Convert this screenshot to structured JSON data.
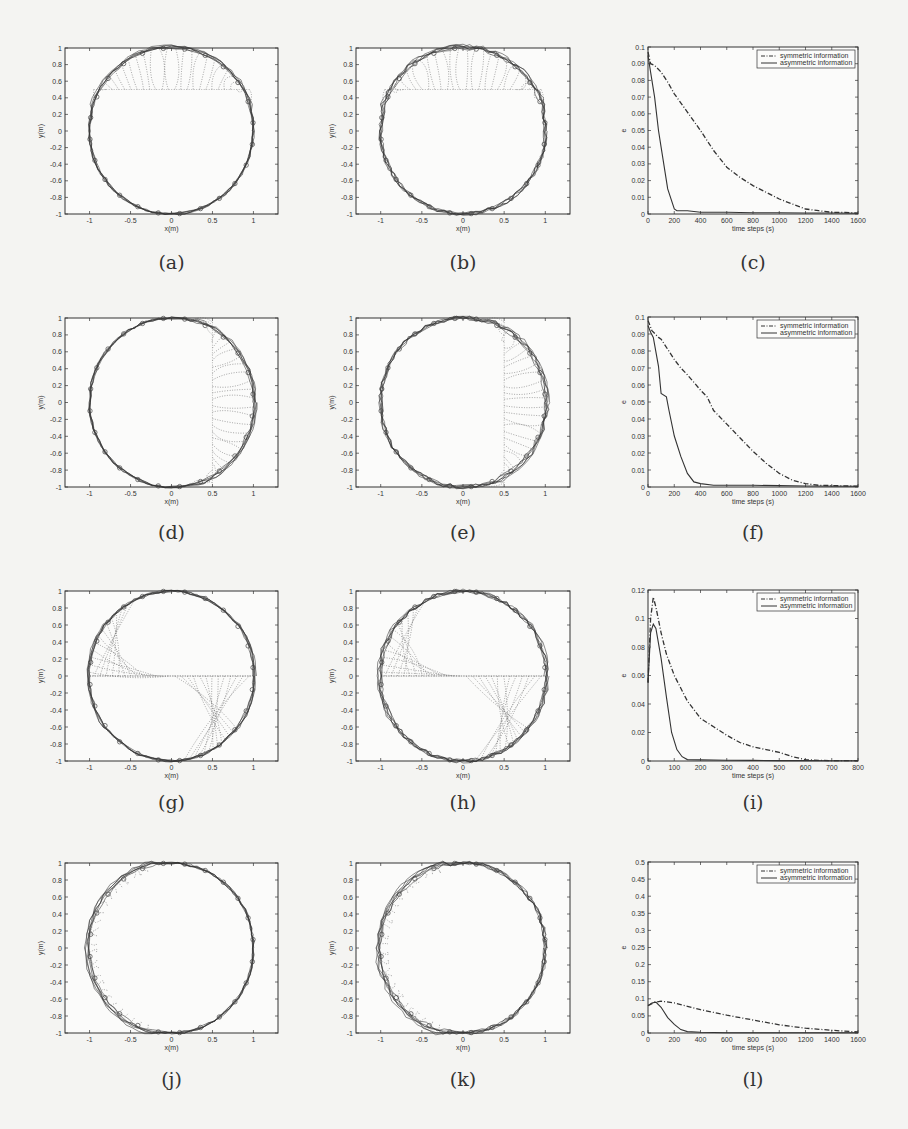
{
  "figure": {
    "panels": [
      {
        "id": "a",
        "label": "(a)",
        "kind": "trajectory",
        "start": "top-band",
        "box": [
          65,
          48,
          278,
          214
        ],
        "label_y": 263
      },
      {
        "id": "b",
        "label": "(b)",
        "kind": "trajectory",
        "start": "top-band",
        "box": [
          356,
          48,
          570,
          214
        ],
        "label_y": 263
      },
      {
        "id": "c",
        "label": "(c)",
        "kind": "error",
        "box": [
          648,
          47,
          858,
          214
        ],
        "label_y": 263
      },
      {
        "id": "d",
        "label": "(d)",
        "kind": "trajectory",
        "start": "right-band",
        "box": [
          65,
          318,
          278,
          487
        ],
        "label_y": 533
      },
      {
        "id": "e",
        "label": "(e)",
        "kind": "trajectory",
        "start": "right-band",
        "box": [
          356,
          318,
          570,
          487
        ],
        "label_y": 533
      },
      {
        "id": "f",
        "label": "(f)",
        "kind": "error",
        "box": [
          648,
          317,
          858,
          487
        ],
        "label_y": 533
      },
      {
        "id": "g",
        "label": "(g)",
        "kind": "trajectory",
        "start": "center-line",
        "box": [
          65,
          591,
          278,
          761
        ],
        "label_y": 803
      },
      {
        "id": "h",
        "label": "(h)",
        "kind": "trajectory",
        "start": "center-line",
        "box": [
          356,
          591,
          570,
          761
        ],
        "label_y": 803
      },
      {
        "id": "i",
        "label": "(i)",
        "kind": "error",
        "box": [
          648,
          590,
          858,
          761
        ],
        "label_y": 803
      },
      {
        "id": "j",
        "label": "(j)",
        "kind": "trajectory",
        "start": "left-arc",
        "box": [
          65,
          863,
          278,
          1033
        ],
        "label_y": 1080
      },
      {
        "id": "k",
        "label": "(k)",
        "kind": "trajectory",
        "start": "left-arc",
        "box": [
          356,
          863,
          570,
          1033
        ],
        "label_y": 1080
      },
      {
        "id": "l",
        "label": "(l)",
        "kind": "error",
        "box": [
          648,
          862,
          858,
          1033
        ],
        "label_y": 1080
      }
    ]
  },
  "chart_data": [
    {
      "panel": "a",
      "type": "line",
      "title": "",
      "xlabel": "x(m)",
      "ylabel": "y(m)",
      "xlim": [
        -1.3,
        1.3
      ],
      "ylim": [
        -1,
        1
      ],
      "xticks": [
        -1,
        -0.5,
        0,
        0.5,
        1
      ],
      "yticks": [
        -1,
        -0.8,
        -0.6,
        -0.4,
        -0.2,
        0,
        0.2,
        0.4,
        0.6,
        0.8,
        1
      ],
      "grid": false,
      "description": "Agents start on horizontal line y=0.5 and converge onto unit circle"
    },
    {
      "panel": "b",
      "type": "line",
      "title": "",
      "xlabel": "x(m)",
      "ylabel": "y(m)",
      "xlim": [
        -1.3,
        1.3
      ],
      "ylim": [
        -1,
        1
      ],
      "xticks": [
        -1,
        -0.5,
        0,
        0.5,
        1
      ],
      "yticks": [
        -1,
        -0.8,
        -0.6,
        -0.4,
        -0.2,
        0,
        0.2,
        0.4,
        0.6,
        0.8,
        1
      ],
      "grid": false,
      "description": "Agents start on horizontal line y=0.5 and converge onto unit circle"
    },
    {
      "panel": "c",
      "type": "line",
      "title": "",
      "xlabel": "time steps (s)",
      "ylabel": "e",
      "xlim": [
        0,
        1600
      ],
      "ylim": [
        0,
        0.1
      ],
      "xticks": [
        0,
        200,
        400,
        600,
        800,
        1000,
        1200,
        1400,
        1600
      ],
      "yticks": [
        0,
        0.01,
        0.02,
        0.03,
        0.04,
        0.05,
        0.06,
        0.07,
        0.08,
        0.09,
        0.1
      ],
      "legend": [
        "symmetric information",
        "asymmetric information"
      ],
      "legend_position": "upper right",
      "series": [
        {
          "name": "symmetric information",
          "style": "dashdot",
          "x": [
            0,
            20,
            50,
            100,
            150,
            200,
            300,
            400,
            500,
            600,
            700,
            800,
            900,
            1000,
            1100,
            1200,
            1300,
            1400,
            1500,
            1600
          ],
          "values": [
            0.097,
            0.09,
            0.089,
            0.085,
            0.079,
            0.072,
            0.061,
            0.05,
            0.038,
            0.028,
            0.022,
            0.017,
            0.013,
            0.009,
            0.006,
            0.003,
            0.002,
            0.001,
            0.001,
            0.0005
          ]
        },
        {
          "name": "asymmetric information",
          "style": "solid",
          "x": [
            0,
            20,
            50,
            80,
            100,
            150,
            200,
            220,
            300,
            400,
            600,
            800,
            1000,
            1200,
            1400,
            1600
          ],
          "values": [
            0.095,
            0.085,
            0.07,
            0.05,
            0.04,
            0.015,
            0.003,
            0.002,
            0.002,
            0.001,
            0.001,
            0.0008,
            0.0008,
            0.0006,
            0.0006,
            0.0005
          ]
        }
      ]
    },
    {
      "panel": "d",
      "type": "line",
      "title": "",
      "xlabel": "x(m)",
      "ylabel": "y(m)",
      "xlim": [
        -1.3,
        1.3
      ],
      "ylim": [
        -1,
        1
      ],
      "xticks": [
        -1,
        -0.5,
        0,
        0.5,
        1
      ],
      "yticks": [
        -1,
        -0.8,
        -0.6,
        -0.4,
        -0.2,
        0,
        0.2,
        0.4,
        0.6,
        0.8,
        1
      ],
      "grid": false,
      "description": "Agents start on vertical line x=0.5 and converge onto unit circle"
    },
    {
      "panel": "e",
      "type": "line",
      "title": "",
      "xlabel": "x(m)",
      "ylabel": "y(m)",
      "xlim": [
        -1.3,
        1.3
      ],
      "ylim": [
        -1,
        1
      ],
      "xticks": [
        -1,
        -0.5,
        0,
        0.5,
        1
      ],
      "yticks": [
        -1,
        -0.8,
        -0.6,
        -0.4,
        -0.2,
        0,
        0.2,
        0.4,
        0.6,
        0.8,
        1
      ],
      "grid": false,
      "description": "Agents start on vertical line x=0.5 and converge onto unit circle"
    },
    {
      "panel": "f",
      "type": "line",
      "title": "",
      "xlabel": "time steps (s)",
      "ylabel": "e",
      "xlim": [
        0,
        1600
      ],
      "ylim": [
        0,
        0.1
      ],
      "xticks": [
        0,
        200,
        400,
        600,
        800,
        1000,
        1200,
        1400,
        1600
      ],
      "yticks": [
        0,
        0.01,
        0.02,
        0.03,
        0.04,
        0.05,
        0.06,
        0.07,
        0.08,
        0.09,
        0.1
      ],
      "legend": [
        "symmetric information",
        "asymmetric information"
      ],
      "legend_position": "upper right",
      "series": [
        {
          "name": "symmetric information",
          "style": "dashdot",
          "x": [
            0,
            30,
            80,
            100,
            150,
            200,
            250,
            300,
            400,
            450,
            500,
            600,
            700,
            800,
            900,
            1000,
            1100,
            1200,
            1300,
            1600
          ],
          "values": [
            0.098,
            0.092,
            0.088,
            0.087,
            0.081,
            0.075,
            0.07,
            0.066,
            0.057,
            0.053,
            0.045,
            0.037,
            0.029,
            0.021,
            0.014,
            0.008,
            0.004,
            0.002,
            0.001,
            0.0005
          ]
        },
        {
          "name": "asymmetric information",
          "style": "solid",
          "x": [
            0,
            20,
            40,
            80,
            100,
            140,
            160,
            200,
            250,
            300,
            350,
            400,
            500,
            600,
            800,
            1000,
            1200,
            1600
          ],
          "values": [
            0.095,
            0.091,
            0.088,
            0.071,
            0.055,
            0.053,
            0.045,
            0.03,
            0.018,
            0.008,
            0.003,
            0.002,
            0.001,
            0.001,
            0.001,
            0.0008,
            0.0006,
            0.0005
          ]
        }
      ]
    },
    {
      "panel": "g",
      "type": "line",
      "title": "",
      "xlabel": "x(m)",
      "ylabel": "y(m)",
      "xlim": [
        -1.3,
        1.3
      ],
      "ylim": [
        -1,
        1
      ],
      "xticks": [
        -1,
        -0.5,
        0,
        0.5,
        1
      ],
      "yticks": [
        -1,
        -0.8,
        -0.6,
        -0.4,
        -0.2,
        0,
        0.2,
        0.4,
        0.6,
        0.8,
        1
      ],
      "grid": false,
      "description": "Agents start on horizontal diameter y=0 and converge onto unit circle"
    },
    {
      "panel": "h",
      "type": "line",
      "title": "",
      "xlabel": "x(m)",
      "ylabel": "y(m)",
      "xlim": [
        -1.3,
        1.3
      ],
      "ylim": [
        -1,
        1
      ],
      "xticks": [
        -1,
        -0.5,
        0,
        0.5,
        1
      ],
      "yticks": [
        -1,
        -0.8,
        -0.6,
        -0.4,
        -0.2,
        0,
        0.2,
        0.4,
        0.6,
        0.8,
        1
      ],
      "grid": false,
      "description": "Agents start on horizontal diameter y=0 and converge onto unit circle"
    },
    {
      "panel": "i",
      "type": "line",
      "title": "",
      "xlabel": "time steps (s)",
      "ylabel": "e",
      "xlim": [
        0,
        800
      ],
      "ylim": [
        0,
        0.12
      ],
      "xticks": [
        0,
        100,
        200,
        300,
        400,
        500,
        600,
        700,
        800
      ],
      "yticks": [
        0,
        0.02,
        0.04,
        0.06,
        0.08,
        0.1,
        0.12
      ],
      "legend": [
        "symmetric information",
        "asymmetric information"
      ],
      "legend_position": "upper right",
      "series": [
        {
          "name": "symmetric information",
          "style": "dashdot",
          "x": [
            0,
            10,
            20,
            30,
            50,
            70,
            100,
            150,
            200,
            250,
            300,
            350,
            400,
            450,
            500,
            550,
            600,
            650,
            700,
            800
          ],
          "values": [
            0.055,
            0.1,
            0.115,
            0.108,
            0.09,
            0.075,
            0.06,
            0.042,
            0.03,
            0.024,
            0.018,
            0.013,
            0.01,
            0.008,
            0.006,
            0.003,
            0.001,
            0.0005,
            0.0003,
            0.0002
          ]
        },
        {
          "name": "asymmetric information",
          "style": "solid",
          "x": [
            0,
            10,
            20,
            30,
            50,
            70,
            90,
            110,
            130,
            150,
            200,
            300,
            400,
            500,
            600,
            700,
            800
          ],
          "values": [
            0.055,
            0.09,
            0.096,
            0.093,
            0.072,
            0.045,
            0.02,
            0.008,
            0.003,
            0.001,
            0.0008,
            0.0005,
            0.0004,
            0.0003,
            0.0003,
            0.0002,
            0.0002
          ]
        }
      ]
    },
    {
      "panel": "j",
      "type": "line",
      "title": "",
      "xlabel": "x(m)",
      "ylabel": "y(m)",
      "xlim": [
        -1.3,
        1.3
      ],
      "ylim": [
        -1,
        1
      ],
      "xticks": [
        -1,
        -0.5,
        0,
        0.5,
        1
      ],
      "yticks": [
        -1,
        -0.8,
        -0.6,
        -0.4,
        -0.2,
        0,
        0.2,
        0.4,
        0.6,
        0.8,
        1
      ],
      "grid": false,
      "description": "Agents start on left arc and converge onto unit circle"
    },
    {
      "panel": "k",
      "type": "line",
      "title": "",
      "xlabel": "x(m)",
      "ylabel": "y(m)",
      "xlim": [
        -1.3,
        1.3
      ],
      "ylim": [
        -1,
        1
      ],
      "xticks": [
        -1,
        -0.5,
        0,
        0.5,
        1
      ],
      "yticks": [
        -1,
        -0.8,
        -0.6,
        -0.4,
        -0.2,
        0,
        0.2,
        0.4,
        0.6,
        0.8,
        1
      ],
      "grid": false,
      "description": "Agents start on left arc and converge onto unit circle"
    },
    {
      "panel": "l",
      "type": "line",
      "title": "",
      "xlabel": "time steps (s)",
      "ylabel": "e",
      "xlim": [
        0,
        1600
      ],
      "ylim": [
        0,
        0.5
      ],
      "xticks": [
        0,
        200,
        400,
        600,
        800,
        1000,
        1200,
        1400,
        1600
      ],
      "yticks": [
        0,
        0.05,
        0.1,
        0.15,
        0.2,
        0.25,
        0.3,
        0.35,
        0.4,
        0.45,
        0.5
      ],
      "legend": [
        "symmetric information",
        "asymmetric information"
      ],
      "legend_position": "upper right",
      "series": [
        {
          "name": "symmetric information",
          "style": "dashdot",
          "x": [
            0,
            50,
            100,
            200,
            300,
            400,
            600,
            800,
            1000,
            1200,
            1400,
            1600
          ],
          "values": [
            0.08,
            0.09,
            0.093,
            0.088,
            0.078,
            0.068,
            0.052,
            0.038,
            0.024,
            0.014,
            0.008,
            0.003
          ]
        },
        {
          "name": "asymmetric information",
          "style": "solid",
          "x": [
            0,
            30,
            60,
            100,
            150,
            200,
            250,
            300,
            400,
            600,
            800,
            1600
          ],
          "values": [
            0.08,
            0.088,
            0.09,
            0.075,
            0.045,
            0.025,
            0.01,
            0.004,
            0.002,
            0.001,
            0.001,
            0.0005
          ]
        }
      ]
    }
  ]
}
